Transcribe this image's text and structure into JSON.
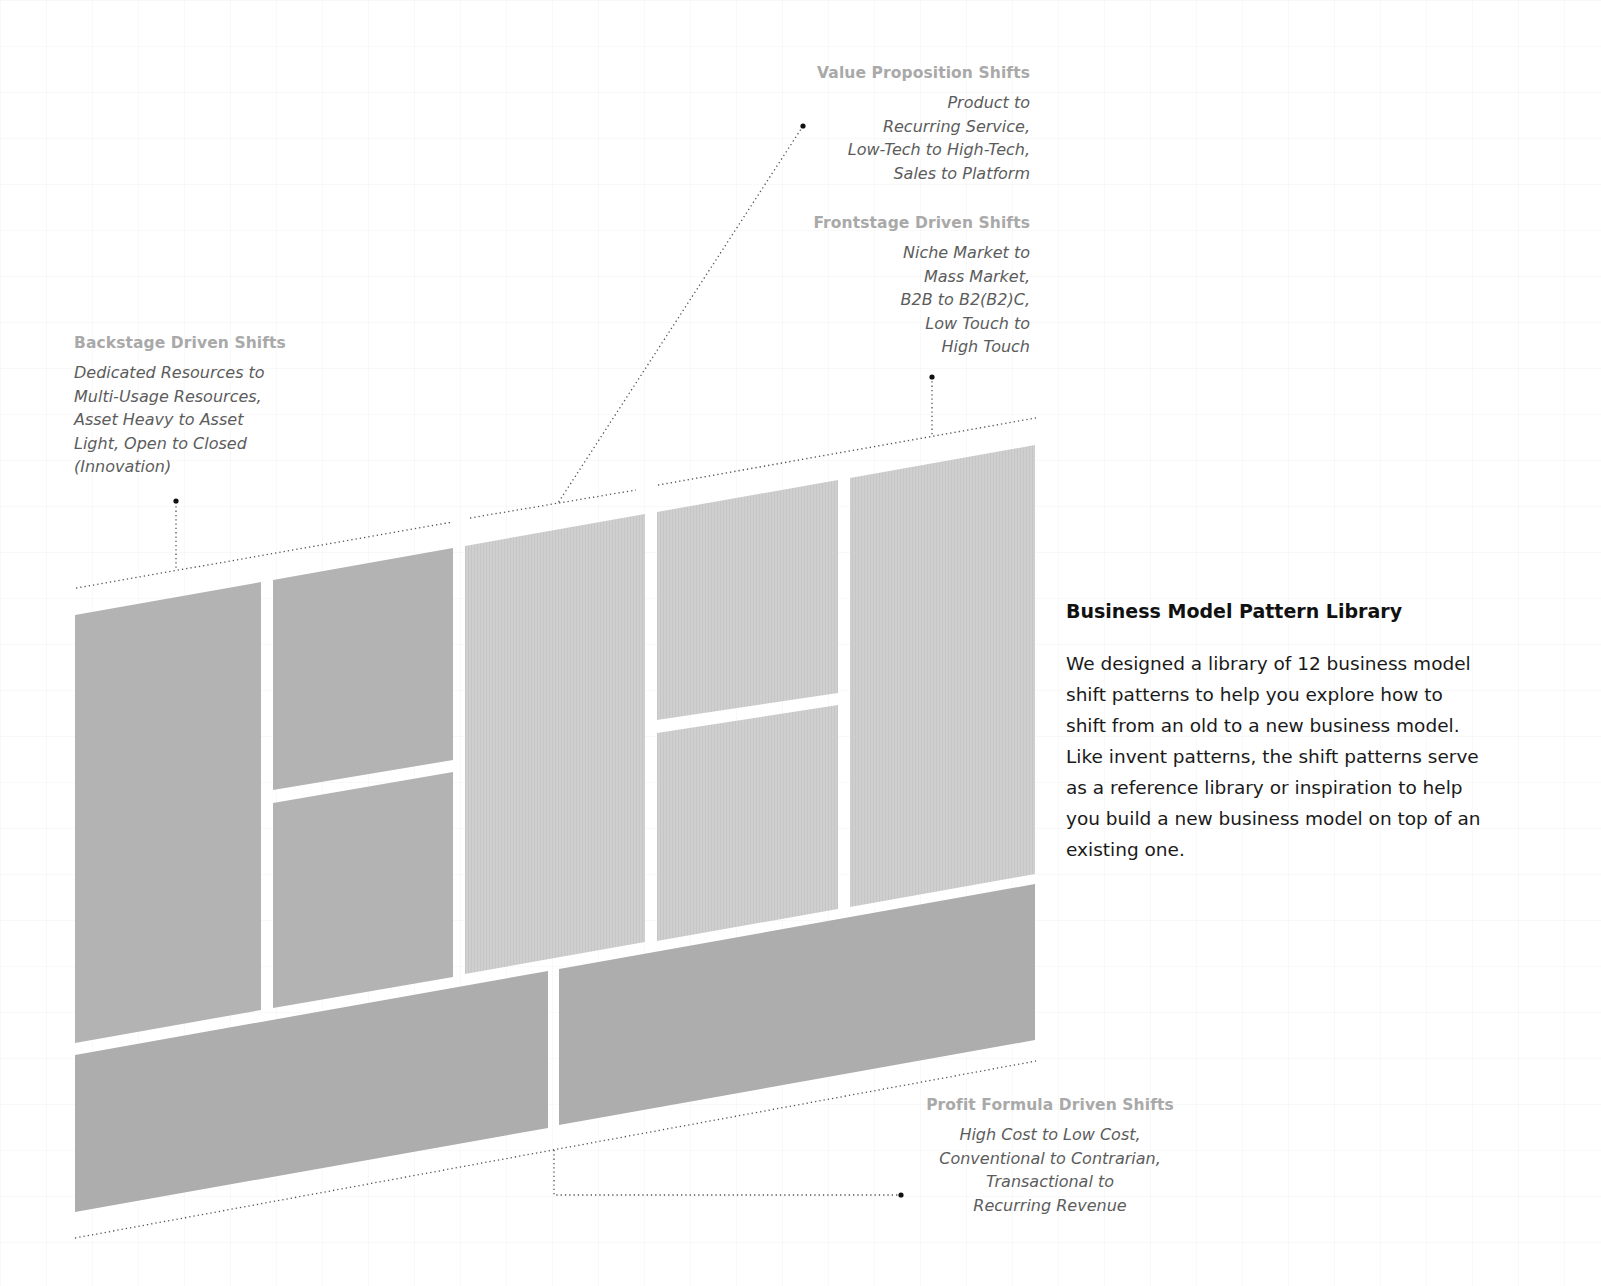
{
  "annotations": {
    "value_proposition": {
      "title": "Value Proposition Shifts",
      "lines": [
        "Product to",
        "Recurring Service,",
        "Low-Tech to High-Tech,",
        "Sales to Platform"
      ]
    },
    "frontstage": {
      "title": "Frontstage Driven Shifts",
      "lines": [
        "Niche Market to",
        "Mass Market,",
        "B2B to B2(B2)C,",
        "Low Touch to",
        "High Touch"
      ]
    },
    "backstage": {
      "title": "Backstage Driven Shifts",
      "lines": [
        "Dedicated Resources to",
        "Multi-Usage Resources,",
        "Asset Heavy to Asset",
        "Light, Open to Closed",
        "(Innovation)"
      ]
    },
    "profit_formula": {
      "title": "Profit Formula Driven Shifts",
      "lines": [
        "High Cost to Low Cost,",
        "Conventional to Contrarian,",
        "Transactional to",
        "Recurring Revenue"
      ]
    }
  },
  "side_panel": {
    "title": "Business Model Pattern Library",
    "body_lines": [
      "We designed a library of 12 business model",
      "shift patterns to help you explore how to",
      "shift from an old to a new business model.",
      "Like invent patterns, the shift patterns serve",
      "as a reference library or inspiration to help",
      "you build a new business model on top of an",
      "existing one."
    ]
  },
  "colors": {
    "backstage_block": "#b3b3b3",
    "value_proposition_block": "#cfcfcf",
    "frontstage_block": "#cbcbcb",
    "profit_block": "#adadad",
    "annotation_title": "#a9a9a9",
    "annotation_body": "#5c5c5c",
    "leader_line": "#444444"
  }
}
